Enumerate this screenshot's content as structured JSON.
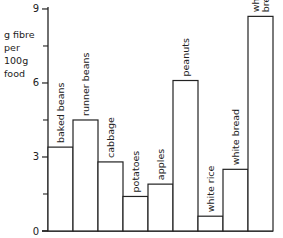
{
  "chart_data": {
    "type": "bar",
    "title": "",
    "xlabel": "",
    "ylabel": "g fibre per 100g food",
    "ylabel_lines": [
      "g fibre",
      "per",
      "100g",
      "food"
    ],
    "ylim": [
      0,
      9
    ],
    "yticks": [
      0,
      3,
      6,
      9
    ],
    "minor_yticks": [
      1.5,
      4.5,
      7.5
    ],
    "grid": false,
    "legend": null,
    "categories": [
      "baked beans",
      "runner beans",
      "cabbage",
      "potatoes",
      "apples",
      "peanuts",
      "white rice",
      "white bread",
      "wholemeal bread"
    ],
    "label_lines": [
      [
        "baked beans"
      ],
      [
        "runner beans"
      ],
      [
        "cabbage"
      ],
      [
        "potatoes"
      ],
      [
        "apples"
      ],
      [
        "peanuts"
      ],
      [
        "white rice"
      ],
      [
        "white bread"
      ],
      [
        "wholemeal",
        "bread"
      ]
    ],
    "values": [
      3.4,
      4.5,
      2.8,
      1.4,
      1.9,
      6.1,
      0.6,
      2.5,
      8.7
    ]
  }
}
